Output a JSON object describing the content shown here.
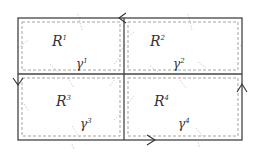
{
  "diagram": {
    "outer_rect": {
      "x": 18,
      "y": 18,
      "w": 224,
      "h": 122
    },
    "divider_x": 124,
    "divider_y": 74,
    "line_color": "#444444",
    "dash_color": "#9a9a9a",
    "regions": [
      {
        "label": "R",
        "sup": "1",
        "x": 52,
        "y": 46
      },
      {
        "label": "R",
        "sup": "2",
        "x": 150,
        "y": 46
      },
      {
        "label": "R",
        "sup": "3",
        "x": 56,
        "y": 106
      },
      {
        "label": "R",
        "sup": "4",
        "x": 154,
        "y": 106
      }
    ],
    "curves": [
      {
        "label": "γ",
        "sup": "1",
        "x": 76,
        "y": 68
      },
      {
        "label": "γ",
        "sup": "2",
        "x": 173,
        "y": 68
      },
      {
        "label": "γ",
        "sup": "3",
        "x": 80,
        "y": 128
      },
      {
        "label": "γ",
        "sup": "4",
        "x": 178,
        "y": 128
      }
    ],
    "arrows": [
      {
        "name": "top-arrow",
        "direction": "left",
        "x": 120,
        "y": 18
      },
      {
        "name": "left-arrow",
        "direction": "down",
        "x": 18,
        "y": 82
      },
      {
        "name": "right-arrow",
        "direction": "up",
        "x": 242,
        "y": 88
      },
      {
        "name": "bottom-arrow",
        "direction": "right",
        "x": 152,
        "y": 140
      }
    ]
  }
}
